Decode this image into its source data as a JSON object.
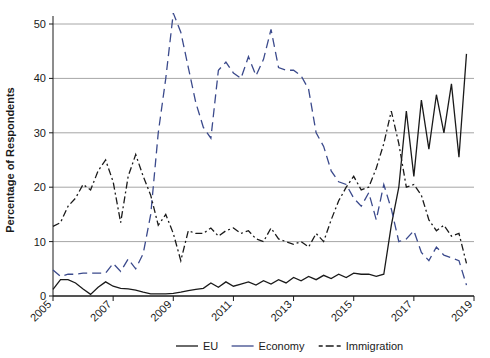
{
  "chart_data": {
    "type": "line",
    "title": "",
    "xlabel": "",
    "ylabel": "Percentage of Respondents",
    "xlim": [
      2005,
      2019
    ],
    "ylim": [
      0,
      52
    ],
    "yticks": [
      0,
      10,
      20,
      30,
      40,
      50
    ],
    "xticks": [
      2005,
      2007,
      2009,
      2011,
      2013,
      2015,
      2017,
      2019
    ],
    "grid": "horizontal",
    "legend_position": "bottom",
    "series": [
      {
        "name": "EU",
        "color": "#1a1a1a",
        "style": "solid",
        "x": [
          2005.0,
          2005.25,
          2005.5,
          2005.75,
          2006.0,
          2006.25,
          2006.5,
          2006.75,
          2007.0,
          2007.25,
          2007.5,
          2007.75,
          2008.0,
          2008.25,
          2008.5,
          2008.75,
          2009.0,
          2009.25,
          2009.5,
          2009.75,
          2010.0,
          2010.25,
          2010.5,
          2010.75,
          2011.0,
          2011.25,
          2011.5,
          2011.75,
          2012.0,
          2012.25,
          2012.5,
          2012.75,
          2013.0,
          2013.25,
          2013.5,
          2013.75,
          2014.0,
          2014.25,
          2014.5,
          2014.75,
          2015.0,
          2015.25,
          2015.5,
          2015.75,
          2016.0,
          2016.25,
          2016.5,
          2016.75,
          2017.0,
          2017.25,
          2017.5,
          2017.75,
          2018.0,
          2018.25,
          2018.5,
          2018.75
        ],
        "y": [
          1.2,
          3.0,
          3.0,
          2.4,
          1.3,
          0.3,
          1.6,
          2.6,
          1.8,
          1.4,
          1.3,
          1.1,
          0.7,
          0.4,
          0.4,
          0.4,
          0.5,
          0.7,
          1.0,
          1.2,
          1.4,
          2.4,
          1.6,
          2.6,
          1.8,
          2.2,
          2.6,
          2.0,
          2.8,
          2.2,
          3.0,
          2.4,
          3.4,
          2.8,
          3.6,
          3.0,
          3.8,
          3.2,
          4.0,
          3.4,
          4.2,
          4.0,
          4.0,
          3.6,
          4.0,
          13.0,
          20.0,
          34.0,
          22.0,
          36.0,
          27.0,
          37.0,
          30.0,
          39.0,
          25.5,
          44.5
        ]
      },
      {
        "name": "Economy",
        "color": "#3b4a8c",
        "style": "dashed",
        "x": [
          2005.0,
          2005.25,
          2005.5,
          2005.75,
          2006.0,
          2006.25,
          2006.5,
          2006.75,
          2007.0,
          2007.25,
          2007.5,
          2007.75,
          2008.0,
          2008.25,
          2008.5,
          2008.75,
          2009.0,
          2009.25,
          2009.5,
          2009.75,
          2010.0,
          2010.25,
          2010.5,
          2010.75,
          2011.0,
          2011.25,
          2011.5,
          2011.75,
          2012.0,
          2012.25,
          2012.5,
          2012.75,
          2013.0,
          2013.25,
          2013.5,
          2013.75,
          2014.0,
          2014.25,
          2014.5,
          2014.75,
          2015.0,
          2015.25,
          2015.5,
          2015.75,
          2016.0,
          2016.25,
          2016.5,
          2016.75,
          2017.0,
          2017.25,
          2017.5,
          2017.75,
          2018.0,
          2018.25,
          2018.5,
          2018.75
        ],
        "y": [
          4.8,
          3.6,
          4.0,
          4.0,
          4.2,
          4.2,
          4.2,
          4.2,
          6.0,
          4.5,
          6.8,
          5.0,
          7.8,
          15.0,
          30.0,
          40.0,
          52.0,
          48.5,
          42.0,
          35.5,
          31.0,
          29.0,
          41.5,
          43.0,
          41.0,
          40.0,
          44.0,
          40.5,
          43.5,
          49.0,
          42.0,
          41.5,
          41.5,
          40.5,
          38.0,
          30.0,
          27.5,
          23.0,
          21.0,
          20.5,
          18.0,
          16.5,
          19.0,
          14.0,
          20.5,
          16.0,
          10.0,
          10.5,
          12.0,
          8.0,
          6.5,
          9.0,
          7.5,
          7.0,
          6.5,
          2.0
        ]
      },
      {
        "name": "Immigration",
        "color": "#1a1a1a",
        "style": "dashdot",
        "x": [
          2005.0,
          2005.25,
          2005.5,
          2005.75,
          2006.0,
          2006.25,
          2006.5,
          2006.75,
          2007.0,
          2007.25,
          2007.5,
          2007.75,
          2008.0,
          2008.25,
          2008.5,
          2008.75,
          2009.0,
          2009.25,
          2009.5,
          2009.75,
          2010.0,
          2010.25,
          2010.5,
          2010.75,
          2011.0,
          2011.25,
          2011.5,
          2011.75,
          2012.0,
          2012.25,
          2012.5,
          2012.75,
          2013.0,
          2013.25,
          2013.5,
          2013.75,
          2014.0,
          2014.25,
          2014.5,
          2014.75,
          2015.0,
          2015.25,
          2015.5,
          2015.75,
          2016.0,
          2016.25,
          2016.5,
          2016.75,
          2017.0,
          2017.25,
          2017.5,
          2017.75,
          2018.0,
          2018.25,
          2018.5,
          2018.75
        ],
        "y": [
          12.8,
          13.5,
          16.5,
          18.0,
          20.5,
          19.5,
          23.0,
          25.0,
          21.0,
          13.5,
          22.0,
          26.0,
          22.0,
          18.5,
          13.0,
          15.0,
          11.5,
          6.5,
          12.0,
          11.5,
          11.5,
          12.5,
          11.0,
          12.0,
          12.5,
          11.5,
          12.0,
          10.5,
          10.0,
          12.5,
          10.5,
          10.0,
          9.5,
          10.0,
          9.0,
          11.5,
          10.0,
          14.0,
          17.5,
          20.0,
          22.0,
          19.5,
          20.0,
          23.5,
          28.0,
          34.0,
          28.0,
          20.0,
          20.5,
          18.5,
          14.0,
          12.0,
          13.0,
          11.0,
          11.5,
          6.0
        ]
      }
    ]
  },
  "axis": {
    "y_label": "Percentage of Respondents",
    "y_ticks": [
      "0",
      "10",
      "20",
      "30",
      "40",
      "50"
    ],
    "x_ticks": [
      "2005",
      "2007",
      "2009",
      "2011",
      "2013",
      "2015",
      "2017",
      "2019"
    ]
  },
  "legend": {
    "items": [
      {
        "label": "EU",
        "color": "#1a1a1a",
        "style": "solid"
      },
      {
        "label": "Economy",
        "color": "#3b4a8c",
        "style": "dashed"
      },
      {
        "label": "Immigration",
        "color": "#1a1a1a",
        "style": "dashdot"
      }
    ]
  },
  "colors": {
    "eu": "#1a1a1a",
    "economy": "#3b4a8c",
    "immigration": "#1a1a1a",
    "grid": "#a6a6a6",
    "axis": "#1a1a1a",
    "background": "#ffffff"
  }
}
